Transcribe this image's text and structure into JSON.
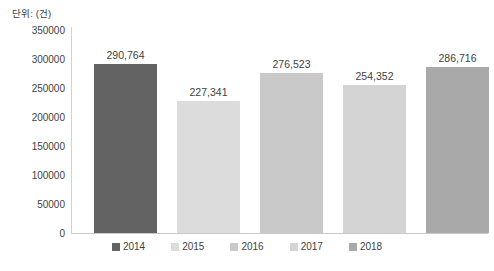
{
  "unit_label": "단위: (건)",
  "chart_data": {
    "type": "bar",
    "title": "",
    "subtitle": "",
    "xlabel": "",
    "ylabel": "단위: (건)",
    "categories": [
      "2014",
      "2015",
      "2016",
      "2017",
      "2018"
    ],
    "values": [
      290764,
      227341,
      276523,
      254352,
      286716
    ],
    "value_labels": [
      "290,764",
      "227,341",
      "276,523",
      "254,352",
      "286,716"
    ],
    "series": [
      {
        "name": "건수",
        "values": [
          290764,
          227341,
          276523,
          254352,
          286716
        ]
      }
    ],
    "colors": [
      "#636363",
      "#dcdcdc",
      "#c9c9c9",
      "#d4d4d4",
      "#a9a9a9"
    ],
    "ylim": [
      0,
      350000
    ],
    "ytick_values": [
      350000,
      300000,
      250000,
      200000,
      150000,
      100000,
      50000,
      0
    ],
    "ytick_labels": [
      "350000",
      "300000",
      "250000",
      "200000",
      "150000",
      "100000",
      "50000",
      "0"
    ],
    "grid": false,
    "legend_position": "bottom",
    "legend": [
      {
        "label": "2014",
        "color": "#636363"
      },
      {
        "label": "2015",
        "color": "#dcdcdc"
      },
      {
        "label": "2016",
        "color": "#c9c9c9"
      },
      {
        "label": "2017",
        "color": "#d4d4d4"
      },
      {
        "label": "2018",
        "color": "#a9a9a9"
      }
    ]
  }
}
